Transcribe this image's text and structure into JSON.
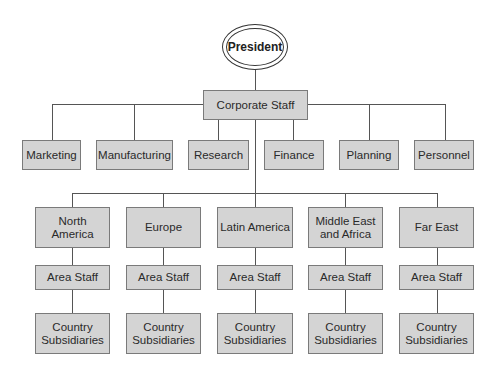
{
  "chart": {
    "top": {
      "label": "President"
    },
    "corporate": {
      "label": "Corporate Staff"
    },
    "departments": [
      {
        "label": "Marketing"
      },
      {
        "label": "Manufacturing"
      },
      {
        "label": "Research"
      },
      {
        "label": "Finance"
      },
      {
        "label": "Planning"
      },
      {
        "label": "Personnel"
      }
    ],
    "regions": [
      {
        "label": "North America",
        "staff": "Area Staff",
        "subsidiaries": "Country Subsidiaries"
      },
      {
        "label": "Europe",
        "staff": "Area Staff",
        "subsidiaries": "Country Subsidiaries"
      },
      {
        "label": "Latin America",
        "staff": "Area Staff",
        "subsidiaries": "Country Subsidiaries"
      },
      {
        "label": "Middle East and Africa",
        "staff": "Area Staff",
        "subsidiaries": "Country Subsidiaries"
      },
      {
        "label": "Far East",
        "staff": "Area Staff",
        "subsidiaries": "Country Subsidiaries"
      }
    ]
  },
  "colors": {
    "box_fill": "#d4d4d4",
    "box_border": "#7a7a7a",
    "line": "#555555"
  }
}
